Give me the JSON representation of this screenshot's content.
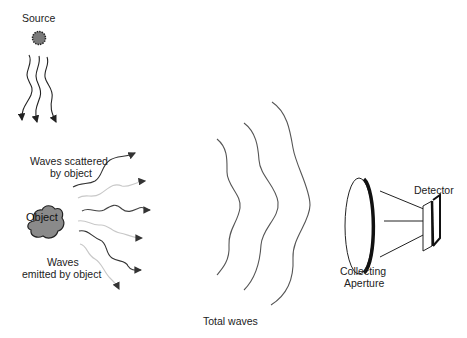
{
  "labels": {
    "source": "Source",
    "scattered_line1": "Waves scattered",
    "scattered_line2": "by object",
    "object": "Object",
    "emitted_line1": "Waves",
    "emitted_line2": "emitted by object",
    "total_waves": "Total waves",
    "detector": "Detector",
    "aperture_line1": "Collecting",
    "aperture_line2": "Aperture"
  },
  "colors": {
    "ink": "#222222",
    "object_fill": "#8a8a8a",
    "source_fill": "#7a7a7a",
    "faint_wave": "#c8c8c8",
    "wave_gray": "#555555"
  }
}
